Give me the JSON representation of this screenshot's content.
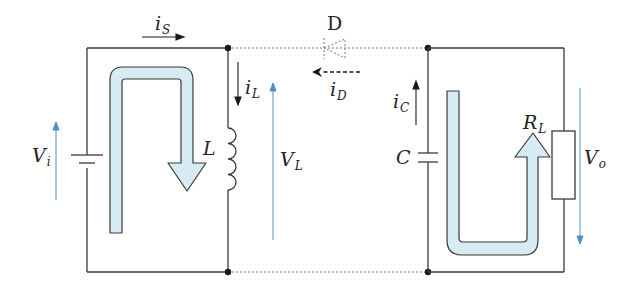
{
  "diagram": {
    "type": "boost-converter-circuit",
    "state": "switch-on (inductor charging, capacitor discharging into load)",
    "colors": {
      "wire": "#3a3a3a",
      "dotted_wire": "#777777",
      "voltage_arrow": "#4a90c8",
      "current_flow_fill": "#d6ebf3",
      "current_flow_stroke": "#3a3a3a"
    },
    "components": {
      "source": {
        "symbol": "battery",
        "voltage_label": "V",
        "voltage_sub": "i"
      },
      "inductor": {
        "label": "L",
        "voltage_label": "V",
        "voltage_sub": "L"
      },
      "diode": {
        "label": "D",
        "state": "off (dotted)"
      },
      "capacitor": {
        "label": "C"
      },
      "load": {
        "label": "R",
        "label_sub": "L",
        "voltage_label": "V",
        "voltage_sub": "o"
      }
    },
    "currents": {
      "source": {
        "label": "i",
        "sub": "S",
        "direction": "right"
      },
      "inductor": {
        "label": "i",
        "sub": "L",
        "direction": "down"
      },
      "diode": {
        "label": "i",
        "sub": "D",
        "direction": "left (dashed)"
      },
      "capacitor": {
        "label": "i",
        "sub": "C",
        "direction": "up"
      }
    },
    "flows": [
      {
        "name": "input-loop",
        "description": "Current from source through inductor (U-shaped arrow pointing down at L)"
      },
      {
        "name": "output-loop",
        "description": "Capacitor discharging through load R_L (U-shaped arrow pointing up at R_L)"
      }
    ]
  }
}
